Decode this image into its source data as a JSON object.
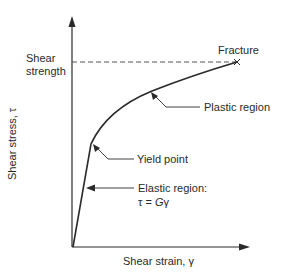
{
  "diagram": {
    "type": "stress-strain-curve",
    "axes": {
      "y_label": "Shear stress, τ",
      "x_label": "Shear strain, γ"
    },
    "reference_line": {
      "label_line1": "Shear",
      "label_line2": "strength",
      "style": "dashed"
    },
    "annotations": {
      "fracture": "Fracture",
      "plastic_region": "Plastic region",
      "yield_point": "Yield point",
      "elastic_region": "Elastic region:",
      "elastic_formula_lhs": "τ = ",
      "elastic_formula_G": "G",
      "elastic_formula_gamma": "γ"
    },
    "colors": {
      "ink": "#2a2a2a",
      "background": "#ffffff"
    }
  }
}
